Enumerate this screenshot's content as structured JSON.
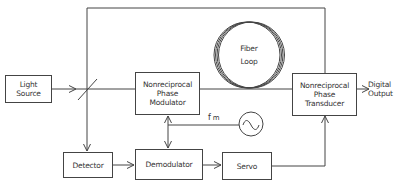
{
  "diagram": {
    "type": "block-diagram",
    "blocks": {
      "light_source": [
        "Light",
        "Source"
      ],
      "phase_modulator": [
        "Nonreciprocal",
        "Phase",
        "Modulator"
      ],
      "fiber_loop": [
        "Fiber",
        "Loop"
      ],
      "phase_transducer": [
        "Nonreciprocal",
        "Phase",
        "Transducer"
      ],
      "detector": [
        "Detector"
      ],
      "demodulator": [
        "Demodulator"
      ],
      "servo": [
        "Servo"
      ]
    },
    "labels": {
      "digital_output": [
        "Digital",
        "Output"
      ],
      "fm": "f",
      "fm_sub": "m",
      "oscillator_symbol": "~"
    },
    "connections": [
      {
        "from": "Light Source",
        "to": "Beam Splitter"
      },
      {
        "from": "Beam Splitter",
        "to": "Nonreciprocal Phase Modulator"
      },
      {
        "from": "Nonreciprocal Phase Modulator",
        "to": "Fiber Loop"
      },
      {
        "from": "Fiber Loop",
        "to": "Nonreciprocal Phase Transducer"
      },
      {
        "from": "Beam Splitter",
        "to": "Nonreciprocal Phase Transducer",
        "via": "top path"
      },
      {
        "from": "Beam Splitter",
        "to": "Detector"
      },
      {
        "from": "Detector",
        "to": "Demodulator"
      },
      {
        "from": "Oscillator f_m",
        "to": "Nonreciprocal Phase Modulator"
      },
      {
        "from": "Oscillator f_m",
        "to": "Demodulator"
      },
      {
        "from": "Demodulator",
        "to": "Servo"
      },
      {
        "from": "Servo",
        "to": "Nonreciprocal Phase Transducer"
      },
      {
        "from": "Nonreciprocal Phase Transducer",
        "to": "Digital Output"
      }
    ]
  }
}
